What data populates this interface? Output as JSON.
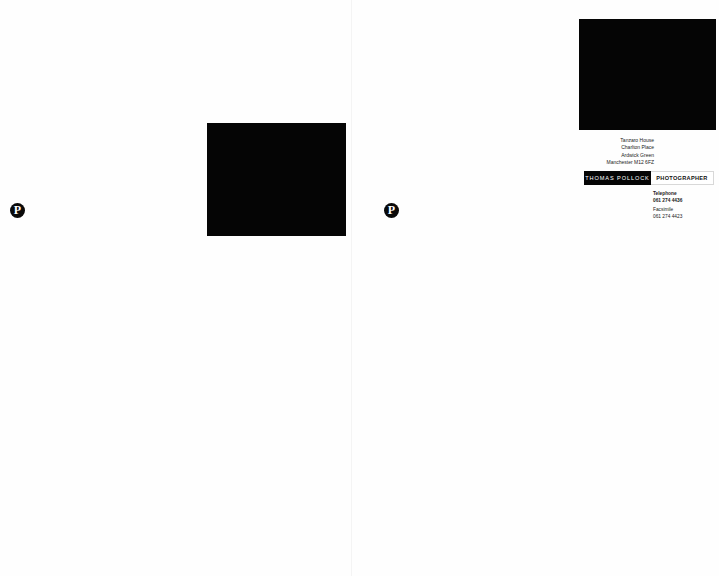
{
  "spread": {
    "left_page": {
      "logo": {
        "icon": "tp-monogram-icon",
        "glyph": "P"
      },
      "photo": {
        "color": "#050505"
      }
    },
    "right_page": {
      "photo": {
        "color": "#050505"
      },
      "logo": {
        "icon": "tp-monogram-icon",
        "glyph": "P"
      },
      "address": {
        "line1": "Tanzaro House",
        "line2": "Charlton Place",
        "line3": "Ardwick Green",
        "line4": "Manchester M12 6FZ"
      },
      "namebar": {
        "name": "THOMAS POLLOCK",
        "title": "PHOTOGRAPHER"
      },
      "contact": {
        "telephone_label": "Telephone",
        "telephone": "061 274 4436",
        "facsimile_label": "Facsimile",
        "facsimile": "061 274 4423"
      }
    }
  }
}
